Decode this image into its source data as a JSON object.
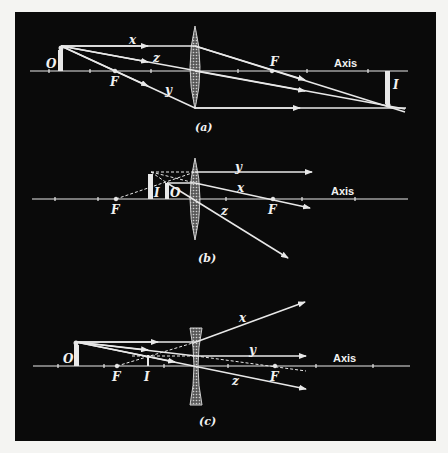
{
  "figure": {
    "background": "#0a0a0a",
    "page_background": "#f4f4f2",
    "line_color": "#e8e8e8",
    "panels": [
      {
        "id": "a",
        "caption": "(a)",
        "lens_type": "converging",
        "axis_label": "Axis",
        "object_label": "O",
        "image_label": "I",
        "focal_labels": [
          "F",
          "F"
        ],
        "ray_labels": {
          "x": "x",
          "y": "y",
          "z": "z"
        }
      },
      {
        "id": "b",
        "caption": "(b)",
        "lens_type": "converging",
        "axis_label": "Axis",
        "object_label": "O",
        "image_label": "I",
        "focal_labels": [
          "F",
          "F"
        ],
        "ray_labels": {
          "x": "x",
          "y": "y",
          "z": "z"
        }
      },
      {
        "id": "c",
        "caption": "(c)",
        "lens_type": "diverging",
        "axis_label": "Axis",
        "object_label": "O",
        "image_label": "I",
        "focal_labels": [
          "F",
          "F"
        ],
        "ray_labels": {
          "x": "x",
          "y": "y",
          "z": "z"
        }
      }
    ]
  }
}
